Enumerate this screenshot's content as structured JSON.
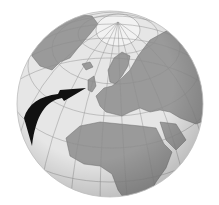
{
  "map": {
    "projection": "orthographic-globe",
    "center_region": "Europe",
    "colors": {
      "ocean": "#e6e6e6",
      "land": "#9a9a9a",
      "ice": "#f2f2f2",
      "graticule": "#8c8c8c",
      "border": "#6e6e6e",
      "arrow": "#111111",
      "shade": "#bdbdbd"
    },
    "annotation": {
      "type": "arrow",
      "from": "Atlantic Ocean (west)",
      "to": "British Isles",
      "icon": "curved-arrow-icon"
    },
    "regions_visible": [
      "Greenland",
      "Arctic",
      "Europe",
      "Russia",
      "Middle East",
      "Africa",
      "Atlantic Ocean"
    ]
  }
}
